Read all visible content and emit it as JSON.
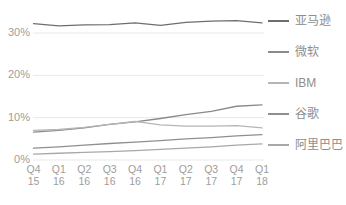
{
  "chart_data": {
    "type": "line",
    "title": "",
    "subtitle": "",
    "xlabel": "",
    "ylabel": "",
    "grid": true,
    "legend_position": "right",
    "ylim": [
      0,
      33
    ],
    "yticks": [
      0,
      10,
      20,
      30
    ],
    "ytick_labels": [
      "0%",
      "10%",
      "20%",
      "30%"
    ],
    "categories": [
      "Q4 15",
      "Q1 16",
      "Q2 16",
      "Q3 16",
      "Q4 16",
      "Q1 17",
      "Q2 17",
      "Q3 17",
      "Q4 17",
      "Q1 18"
    ],
    "xtick_quarters": [
      "Q4",
      "Q1",
      "Q2",
      "Q3",
      "Q4",
      "Q1",
      "Q2",
      "Q3",
      "Q4",
      "Q1"
    ],
    "xtick_years": [
      "15",
      "16",
      "16",
      "16",
      "16",
      "17",
      "17",
      "17",
      "17",
      "18"
    ],
    "series": [
      {
        "name": "亚马逊",
        "color": "#6e6e6e",
        "values": [
          32.2,
          31.7,
          31.9,
          32.0,
          32.4,
          31.8,
          32.5,
          32.8,
          32.9,
          32.4
        ]
      },
      {
        "name": "微软",
        "color": "#8a8a8a",
        "values": [
          6.6,
          7.0,
          7.6,
          8.4,
          9.0,
          9.8,
          10.7,
          11.5,
          12.7,
          13.0
        ]
      },
      {
        "name": "IBM",
        "color": "#b5b5b5",
        "values": [
          7.0,
          7.2,
          7.7,
          8.4,
          9.1,
          8.3,
          8.0,
          8.0,
          8.1,
          7.6
        ]
      },
      {
        "name": "谷歌",
        "color": "#8f8f8f",
        "values": [
          2.8,
          3.1,
          3.5,
          3.9,
          4.2,
          4.6,
          5.0,
          5.3,
          5.7,
          6.0
        ]
      },
      {
        "name": "阿里巴巴",
        "color": "#a8a8a8",
        "values": [
          1.4,
          1.6,
          1.8,
          2.0,
          2.2,
          2.5,
          2.8,
          3.1,
          3.5,
          3.8
        ]
      }
    ]
  },
  "axis": {
    "ytick_labels": [
      "30%",
      "20%",
      "10%",
      "0%"
    ]
  },
  "colors": {
    "gridline": "#e9e9e9",
    "axis_text": "#9d9d9d",
    "legend_text": "#8e8e8e",
    "background": "#ffffff"
  }
}
